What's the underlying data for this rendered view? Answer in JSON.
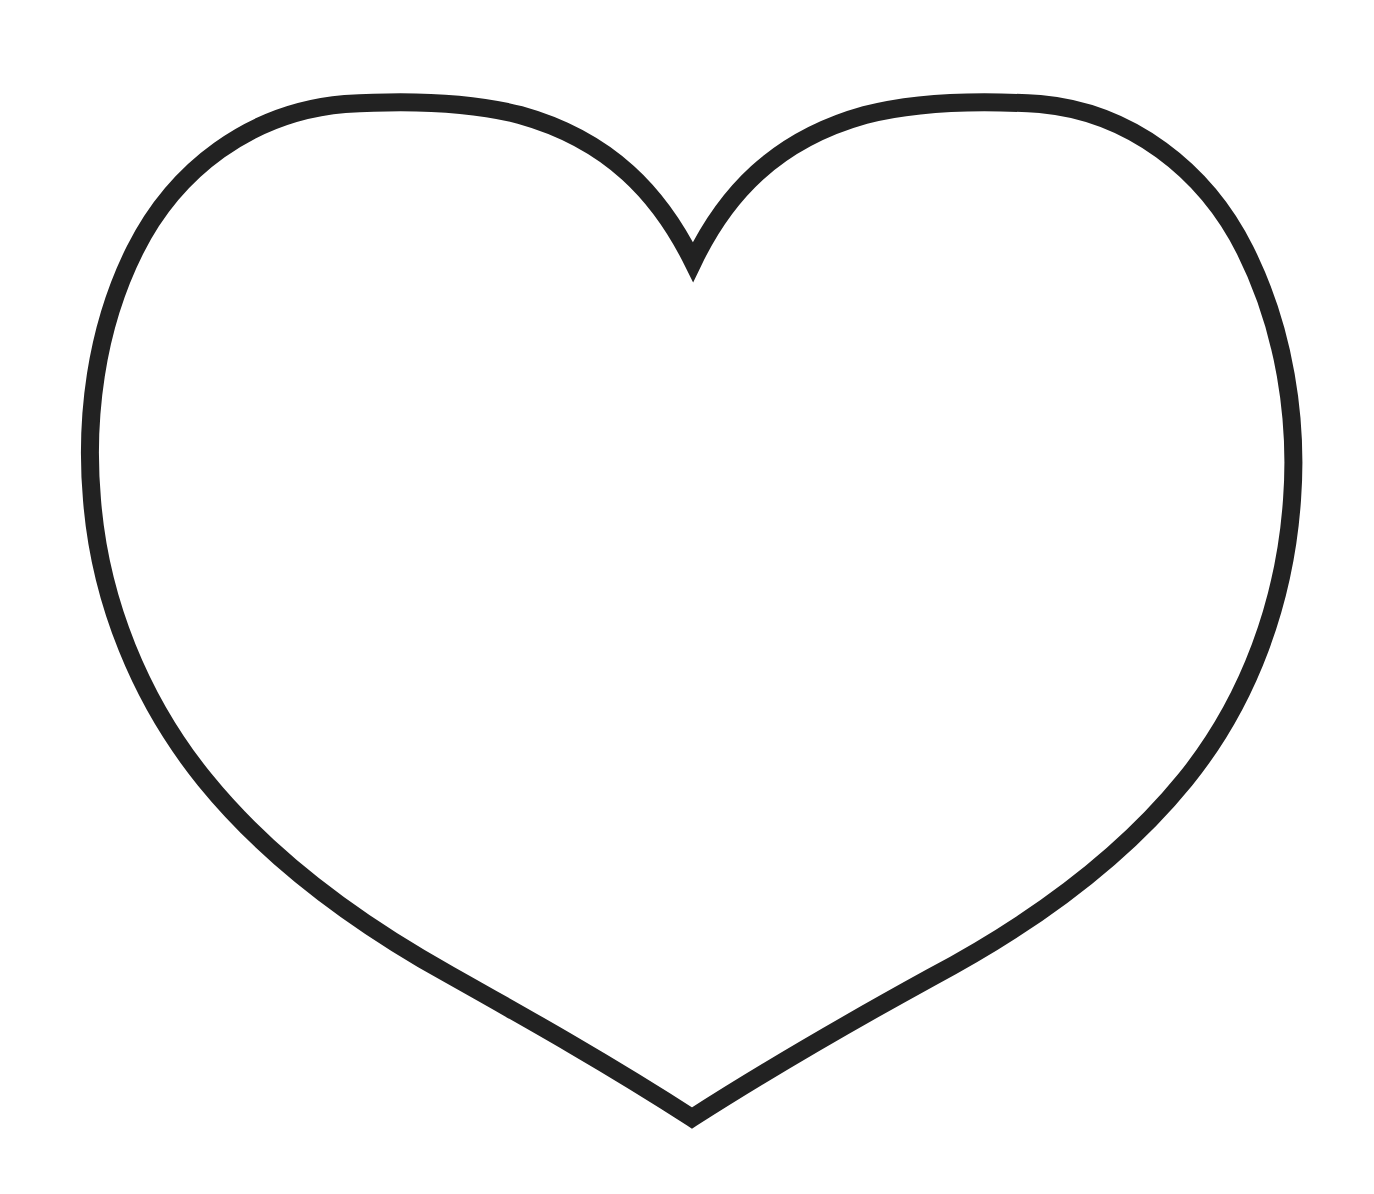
{
  "figure": {
    "shape": "heart-outline",
    "stroke_color": "#222222",
    "fill_color": "#ffffff",
    "background_color": "#ffffff",
    "stroke_width": 18,
    "caption": ""
  }
}
